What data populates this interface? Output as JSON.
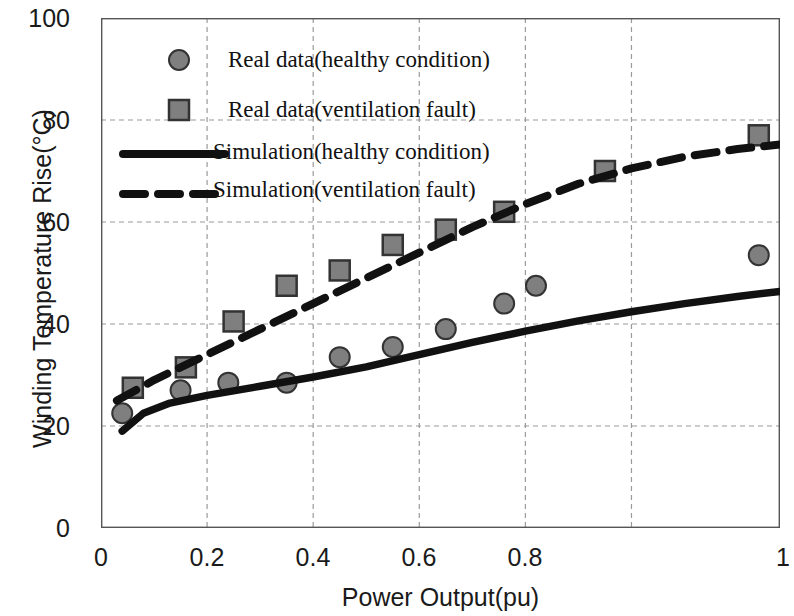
{
  "chart_data": {
    "type": "scatter",
    "title": "",
    "xlabel": "Power Output(pu)",
    "ylabel": "Winding Temperature Rise(°C)",
    "xlim": [
      0,
      1.28
    ],
    "ylim": [
      0,
      100
    ],
    "xticks": [
      "0",
      "0.2",
      "0.4",
      "0.6",
      "0.8",
      "1"
    ],
    "xtick_values": [
      0,
      0.2,
      0.4,
      0.6,
      0.8,
      1.0
    ],
    "yticks": [
      "0",
      "20",
      "40",
      "60",
      "80",
      "100"
    ],
    "ytick_values": [
      0,
      20,
      40,
      60,
      80,
      100
    ],
    "grid": true,
    "grid_style": "dashed",
    "legend_position": "upper-left-inside",
    "series": [
      {
        "name": "Real data(healthy condition)",
        "kind": "scatter",
        "marker": "circle",
        "color": "#7f7f7f",
        "edge_color": "#333333",
        "x": [
          0.04,
          0.15,
          0.24,
          0.35,
          0.45,
          0.55,
          0.65,
          0.76,
          0.82,
          1.24
        ],
        "y": [
          22.5,
          27.0,
          28.5,
          28.5,
          33.5,
          35.5,
          39.0,
          44.0,
          47.5,
          53.5
        ]
      },
      {
        "name": "Real data(ventilation fault)",
        "kind": "scatter",
        "marker": "square",
        "color": "#7f7f7f",
        "edge_color": "#333333",
        "x": [
          0.06,
          0.16,
          0.25,
          0.35,
          0.45,
          0.55,
          0.65,
          0.76,
          0.95,
          1.24
        ],
        "y": [
          27.5,
          31.5,
          40.5,
          47.5,
          50.5,
          55.5,
          58.5,
          62.0,
          70.0,
          77.0
        ]
      },
      {
        "name": "Simulation(healthy condition)",
        "kind": "line",
        "style": "solid",
        "color": "#111111",
        "x": [
          0.04,
          0.08,
          0.13,
          0.2,
          0.3,
          0.4,
          0.5,
          0.6,
          0.7,
          0.8,
          0.9,
          1.0,
          1.1,
          1.2,
          1.28
        ],
        "y": [
          19.0,
          22.5,
          24.5,
          26.0,
          27.8,
          29.6,
          31.6,
          34.0,
          36.4,
          38.6,
          40.6,
          42.4,
          44.0,
          45.4,
          46.4
        ]
      },
      {
        "name": "Simulation(ventilation fault)",
        "kind": "line",
        "style": "dashed",
        "color": "#111111",
        "x": [
          0.03,
          0.1,
          0.2,
          0.3,
          0.4,
          0.5,
          0.6,
          0.7,
          0.8,
          0.9,
          1.0,
          1.1,
          1.2,
          1.28
        ],
        "y": [
          25.0,
          29.0,
          34.0,
          39.0,
          44.0,
          49.0,
          54.0,
          59.0,
          63.5,
          67.5,
          70.5,
          72.8,
          74.3,
          75.2
        ]
      }
    ]
  },
  "legend": {
    "items": [
      {
        "label": "Real data(healthy condition)",
        "symbol": "circle-marker"
      },
      {
        "label": "Real data(ventilation fault)",
        "symbol": "square-marker"
      },
      {
        "label": "Simulation(healthy condition)",
        "symbol": "solid-line"
      },
      {
        "label": "Simulation(ventilation fault)",
        "symbol": "dashed-line"
      }
    ]
  },
  "axes": {
    "x_title": "Power Output(pu)",
    "y_title": "Winding Temperature Rise(°C)",
    "x_ticks": [
      "0",
      "0.2",
      "0.4",
      "0.6",
      "0.8",
      "1"
    ],
    "y_ticks": [
      "0",
      "20",
      "40",
      "60",
      "80",
      "100"
    ]
  },
  "colors": {
    "marker_fill": "#7f7f7f",
    "marker_edge": "#333333",
    "line": "#111111",
    "grid": "#9a9a9a",
    "axis": "#555555",
    "text": "#1a1a1a",
    "background": "#ffffff"
  }
}
